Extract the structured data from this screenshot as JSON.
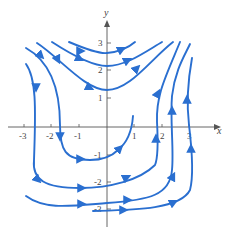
{
  "figure": {
    "type": "phase portrait",
    "axes": {
      "x_label": "x",
      "y_label": "y",
      "x_ticks": [
        "-3",
        "-2",
        "-1",
        "1",
        "2",
        "3"
      ],
      "y_ticks": [
        "3",
        "2",
        "1",
        "-1",
        "-2",
        "-3"
      ]
    },
    "curve_color": "#2a6fd0",
    "axis_color": "#555555",
    "curves": [
      {
        "name": "top-saddle-1",
        "description": "upward-opening curve vertex near (0, 2.7), flow left-to-right"
      },
      {
        "name": "top-saddle-2",
        "description": "upward-opening curve vertex near (0, 2.1), flow left-to-right"
      },
      {
        "name": "top-saddle-3",
        "description": "upward-opening curve vertex near (0, 1.3), flow left-to-right"
      },
      {
        "name": "left-outer-down",
        "description": "curve on left descending near x=-2.8 then sweeping right along y=-2"
      },
      {
        "name": "left-inner-down",
        "description": "curve descending near x=-1.7 then sweeping right along y=-1 and up through x=1"
      },
      {
        "name": "bottom-1",
        "description": "curve from (-3,-2.5) right along y=-2.6 then up at x=2.4"
      },
      {
        "name": "bottom-2",
        "description": "curve from (-0.5,-3.1) right along y=-3 then up at x=3"
      },
      {
        "name": "right-1",
        "description": "curve rising near x=1.8"
      },
      {
        "name": "right-2",
        "description": "curve rising near x=2.4"
      },
      {
        "name": "right-3",
        "description": "curve rising near x=3"
      }
    ]
  }
}
